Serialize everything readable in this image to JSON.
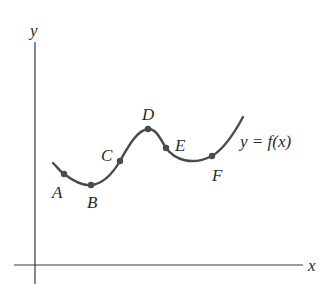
{
  "figure": {
    "axes": {
      "x_label": "x",
      "y_label": "y"
    },
    "curve_label": "y = f(x)",
    "points": [
      {
        "label": "A",
        "x": 64,
        "y": 174,
        "lx": 58,
        "ly": 198
      },
      {
        "label": "B",
        "x": 91,
        "y": 185,
        "lx": 93,
        "ly": 208
      },
      {
        "label": "C",
        "x": 120,
        "y": 161,
        "lx": 108,
        "ly": 161
      },
      {
        "label": "D",
        "x": 148,
        "y": 129,
        "lx": 148,
        "ly": 120
      },
      {
        "label": "E",
        "x": 166,
        "y": 148,
        "lx": 181,
        "ly": 151
      },
      {
        "label": "F",
        "x": 212,
        "y": 156,
        "lx": 218,
        "ly": 181
      }
    ],
    "colors": {
      "curve": "#4a4a4a",
      "axis": "#3a3a3a",
      "text": "#2a2a2a"
    }
  }
}
